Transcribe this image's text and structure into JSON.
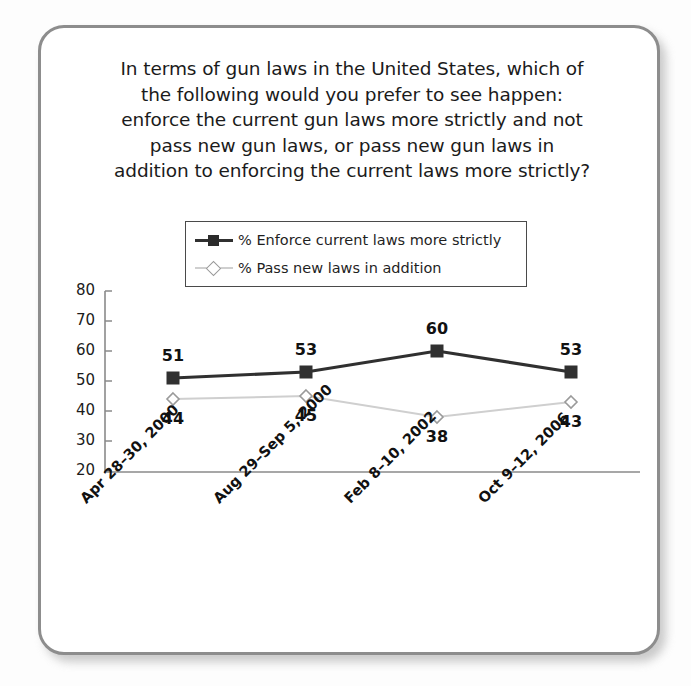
{
  "chart_data": {
    "type": "line",
    "title_lines": [
      "In terms of gun laws in the United States, which of",
      "the following would you prefer to see happen:",
      "enforce the current gun laws more strictly and not",
      "pass new gun laws, or pass new gun laws in",
      "addition to enforcing the current laws more strictly?"
    ],
    "categories": [
      "Apr 28–30, 2000",
      "Aug 29–Sep 5, 2000",
      "Feb 8–10, 2002",
      "Oct 9–12, 2006"
    ],
    "series": [
      {
        "name": "% Enforce current laws more strictly",
        "values": [
          51,
          53,
          60,
          53
        ],
        "color": "#303030",
        "marker": "square",
        "label_position": "above"
      },
      {
        "name": "% Pass new laws in addition",
        "values": [
          44,
          45,
          38,
          43
        ],
        "color": "#cfcfcf",
        "marker": "diamond",
        "label_position": "below"
      }
    ],
    "xlabel": "",
    "ylabel": "",
    "ylim": [
      20,
      80
    ],
    "yticks": [
      80,
      70,
      60,
      50,
      40,
      30,
      20
    ],
    "grid": false,
    "legend_position": "top-center",
    "value_labels_shown": true
  },
  "legend": {
    "items": [
      {
        "label": "% Enforce current laws more strictly",
        "marker": "square-marker-icon",
        "style": "dark"
      },
      {
        "label": "% Pass new laws in addition",
        "marker": "diamond-marker-icon",
        "style": "light"
      }
    ]
  },
  "colors": {
    "series_dark": "#303030",
    "series_light": "#cfcfcf",
    "axis": "#8a8a8a",
    "frame_border": "#8d8d8d",
    "text": "#1b1b1b",
    "background": "#ffffff"
  }
}
